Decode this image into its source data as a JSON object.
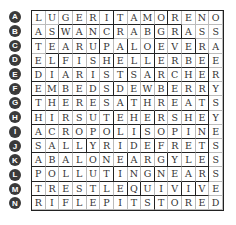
{
  "puzzle": {
    "row_labels": [
      "A",
      "B",
      "C",
      "D",
      "E",
      "F",
      "G",
      "H",
      "I",
      "J",
      "K",
      "L",
      "M",
      "N"
    ],
    "rows": [
      "LUGERITAMORENO",
      "ASWANCRABGRASS",
      "TEARUPALOEVERA",
      "ELFISHELLERBEE",
      "DIARISTSARCHER",
      "EMBEDSDEWBERRY",
      "THERESATHREATS",
      "HIRSUTEHERSHEY",
      "ACROPOLISOPINE",
      "SALLYRIDEFRETS",
      "ABALONEARGYLES",
      "POLLUTINGNEARS",
      "TRESTLEQUIVIVE",
      "RIFLEPITSTORED"
    ]
  }
}
